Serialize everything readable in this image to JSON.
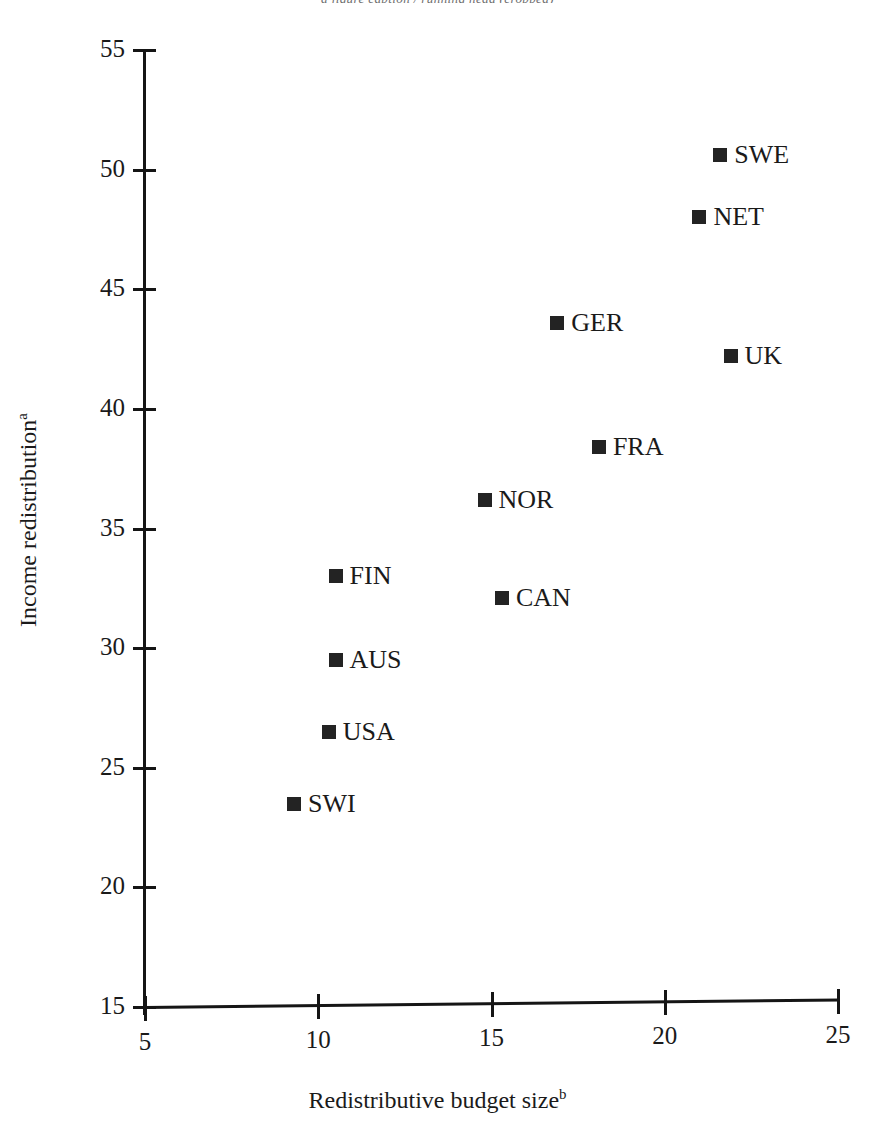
{
  "top_cut_text": "a figure caption / running head (cropped)",
  "chart_data": {
    "type": "scatter",
    "title": "",
    "xlabel": "Redistributive budget size",
    "xlabel_superscript": "b",
    "ylabel": "Income redistribution",
    "ylabel_superscript": "a",
    "xlim": [
      5,
      25
    ],
    "ylim": [
      15,
      55
    ],
    "xticks": [
      5,
      10,
      15,
      20,
      25
    ],
    "yticks": [
      15,
      20,
      25,
      30,
      35,
      40,
      45,
      50,
      55
    ],
    "xtick_labels": [
      "5",
      "10",
      "15",
      "20",
      "25"
    ],
    "ytick_labels": [
      "15",
      "20",
      "25",
      "30",
      "35",
      "40",
      "45",
      "50",
      "55"
    ],
    "grid": false,
    "legend": false,
    "marker": "square",
    "marker_color": "#232323",
    "points": [
      {
        "label": "SWE",
        "x": 21.6,
        "y": 50.6
      },
      {
        "label": "NET",
        "x": 21.0,
        "y": 48.0
      },
      {
        "label": "GER",
        "x": 16.9,
        "y": 43.6
      },
      {
        "label": "UK",
        "x": 21.9,
        "y": 42.2
      },
      {
        "label": "FRA",
        "x": 18.1,
        "y": 38.4
      },
      {
        "label": "NOR",
        "x": 14.8,
        "y": 36.2
      },
      {
        "label": "FIN",
        "x": 10.5,
        "y": 33.0
      },
      {
        "label": "CAN",
        "x": 15.3,
        "y": 32.1
      },
      {
        "label": "AUS",
        "x": 10.5,
        "y": 29.5
      },
      {
        "label": "USA",
        "x": 10.3,
        "y": 26.5
      },
      {
        "label": "SWI",
        "x": 9.3,
        "y": 23.5
      }
    ]
  }
}
